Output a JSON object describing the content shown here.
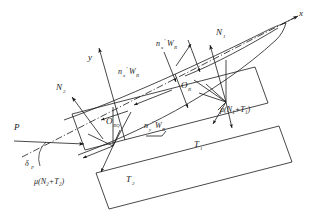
{
  "figure": {
    "type": "engineering-force-diagram",
    "stroke_color": "#1a1a1a",
    "background_color": "#ffffff"
  },
  "axes": {
    "x_label": "x",
    "y_label": "y",
    "centerline_style": "dash-dot"
  },
  "origins": [
    {
      "key": "o_r",
      "label": "O",
      "subscript": "R",
      "x": 185,
      "y": 88
    },
    {
      "key": "o_rq",
      "label": "O",
      "subscript": "RQ",
      "x": 110,
      "y": 124
    }
  ],
  "forces": [
    {
      "key": "p",
      "label": "P",
      "x": 16,
      "y": 131
    },
    {
      "key": "n1",
      "label": "N",
      "sub": "1",
      "x": 218,
      "y": 35
    },
    {
      "key": "n2",
      "label": "N",
      "sub": "2",
      "x": 58,
      "y": 90
    },
    {
      "key": "t1",
      "label": "T",
      "sub": "1",
      "x": 196,
      "y": 144
    },
    {
      "key": "t2",
      "label": "T",
      "sub": "2",
      "x": 128,
      "y": 180
    },
    {
      "key": "nxwr_a",
      "label": "n",
      "sub": "x",
      "prime": "′",
      "tail": "W",
      "tailsub": "R",
      "x": 122,
      "y": 73
    },
    {
      "key": "nxwr_b",
      "label": "n",
      "sub": "x",
      "prime": "′",
      "tail": "W",
      "tailsub": "R",
      "x": 160,
      "y": 47
    },
    {
      "key": "nywr",
      "label": "n",
      "sub": "y",
      "prime": "′",
      "tail": "W",
      "tailsub": "R",
      "x": 150,
      "y": 122
    }
  ],
  "friction_labels": [
    {
      "key": "mu1",
      "text": "μ(N₁+T₁)",
      "x": 222,
      "y": 110
    },
    {
      "key": "mu2",
      "text": "μ(N₂+T₂)",
      "x": 36,
      "y": 182
    }
  ],
  "angle": {
    "key": "delta_p",
    "label": "δ",
    "subscript": "P",
    "x": 27,
    "y": 162
  },
  "colors": {
    "line": "#1a1a1a",
    "text": "#1a1a1a",
    "hull": "#222222"
  }
}
